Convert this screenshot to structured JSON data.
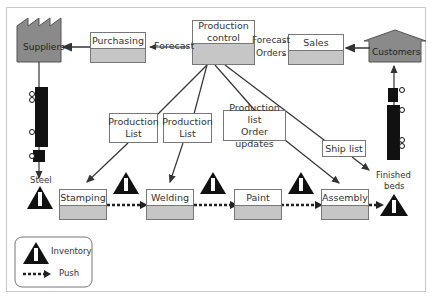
{
  "diagram": {
    "type": "value-stream-map",
    "nodes": {
      "suppliers": "Suppliers",
      "customers": "Customers",
      "purchasing": "Purchasing",
      "production_control": "Production control",
      "production_control_line1": "Production",
      "production_control_line2": "control",
      "sales": "Sales"
    },
    "flows": {
      "forecast_left": "Forecast",
      "forecast_right": "Forecast",
      "orders": "Orders"
    },
    "notes": {
      "production_list_1_l1": "Production",
      "production_list_1_l2": "List",
      "production_list_2_l1": "Production",
      "production_list_2_l2": "List",
      "production_list_3_l1": "Production list",
      "production_list_3_l2": "Order updates",
      "ship_list": "Ship list"
    },
    "processes": [
      "Stamping",
      "Welding",
      "Paint",
      "Assembly"
    ],
    "materials": {
      "steel": "Steel",
      "finished_l1": "Finished",
      "finished_l2": "beds"
    },
    "inventory_symbol": "I",
    "legend": {
      "inventory": "Inventory",
      "push": "Push"
    },
    "colors": {
      "node_fill": "#8a8a8a",
      "process_fill": "#c6c6c6",
      "line": "#333333",
      "inventory": "#111111"
    }
  }
}
